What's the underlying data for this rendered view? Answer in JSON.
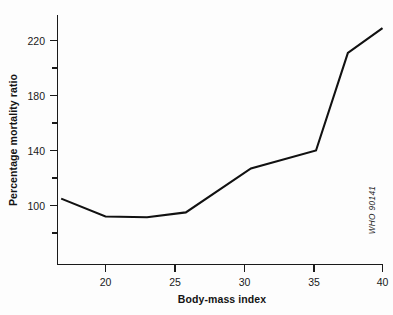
{
  "chart_data": {
    "type": "line",
    "title": "",
    "subtitle": "",
    "xlabel": "Body-mass index",
    "ylabel": "Percentage mortality ratio",
    "xlim": [
      16.6,
      40
    ],
    "ylim": [
      68,
      235
    ],
    "grid": false,
    "legend": null,
    "x_ticks": [
      20,
      25,
      30,
      35,
      40
    ],
    "x_tick_labels": [
      "20",
      "25",
      "30",
      "35",
      "40"
    ],
    "y_ticks": [
      100,
      140,
      180,
      220
    ],
    "y_tick_labels": [
      "100",
      "140",
      "180",
      "220"
    ],
    "y_minor_ticks": [
      80,
      120,
      160,
      200
    ],
    "annotations": [
      {
        "text": "WHO  90141",
        "rotation": -90,
        "position": "right-inside-lower"
      }
    ],
    "series": [
      {
        "name": "Percentage mortality ratio",
        "color": "#111111",
        "x": [
          16.8,
          20.0,
          23.0,
          25.8,
          30.5,
          35.2,
          37.5,
          40.0
        ],
        "y": [
          105,
          92,
          91.5,
          95,
          127,
          140,
          211,
          229
        ]
      }
    ]
  },
  "axes": {
    "x_title": "Body-mass index",
    "y_title": "Percentage mortality ratio"
  },
  "credit": {
    "text": "WHO  90141"
  }
}
